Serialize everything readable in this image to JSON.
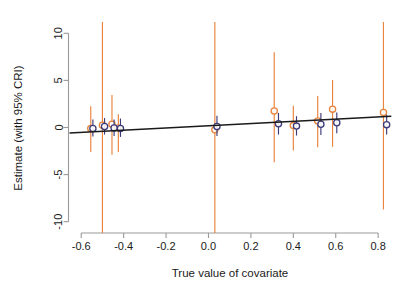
{
  "chart_data": {
    "type": "scatter",
    "title": "",
    "subtitle": "",
    "xlabel": "True value of covariate",
    "ylabel": "Estimate (with 95% CRI)",
    "xlim": [
      -0.66,
      0.87
    ],
    "ylim": [
      -11.2,
      11.2
    ],
    "grid": false,
    "legend": "none",
    "xticks": [
      -0.6,
      -0.4,
      -0.2,
      0.0,
      0.2,
      0.4,
      0.6,
      0.8
    ],
    "xtick_labels": [
      "-0.6",
      "-0.4",
      "-0.2",
      "0.0",
      "0.2",
      "0.4",
      "0.6",
      "0.8"
    ],
    "yticks": [
      -10,
      -5,
      0,
      5,
      10
    ],
    "ytick_labels": [
      "-10",
      "-5",
      "0",
      "5",
      "10"
    ],
    "colors": {
      "series_a": "#E8843C",
      "series_b": "#3B3B7A",
      "fit_line": "#1a1a1a",
      "axis": "#999999",
      "text": "#1a1a1a",
      "background": "#ffffff"
    },
    "series": [
      {
        "name": "series_a",
        "color": "#E8843C",
        "marker": "open-circle",
        "points": [
          {
            "x": -0.555,
            "y": -0.1,
            "lo": -2.6,
            "hi": 2.25
          },
          {
            "x": -0.5,
            "y": 0.25,
            "lo": -11.2,
            "hi": 11.2
          },
          {
            "x": -0.455,
            "y": 0.35,
            "lo": -2.9,
            "hi": 3.45
          },
          {
            "x": -0.425,
            "y": -0.05,
            "lo": -2.6,
            "hi": 1.4
          },
          {
            "x": 0.03,
            "y": -0.25,
            "lo": -11.2,
            "hi": 11.2
          },
          {
            "x": 0.31,
            "y": 1.75,
            "lo": -3.7,
            "hi": 8.0
          },
          {
            "x": 0.4,
            "y": 0.2,
            "lo": -2.45,
            "hi": 2.3
          },
          {
            "x": 0.515,
            "y": 0.7,
            "lo": -2.1,
            "hi": 3.35
          },
          {
            "x": 0.585,
            "y": 1.95,
            "lo": -2.05,
            "hi": 5.05
          },
          {
            "x": 0.825,
            "y": 1.6,
            "lo": -8.7,
            "hi": 11.2
          }
        ]
      },
      {
        "name": "series_b",
        "color": "#3B3B7A",
        "marker": "open-circle",
        "points": [
          {
            "x": -0.545,
            "y": -0.1,
            "lo": -0.95,
            "hi": 0.85
          },
          {
            "x": -0.49,
            "y": 0.1,
            "lo": -0.75,
            "hi": 1.0
          },
          {
            "x": -0.445,
            "y": -0.05,
            "lo": -0.9,
            "hi": 0.85
          },
          {
            "x": -0.415,
            "y": -0.1,
            "lo": -1.0,
            "hi": 0.95
          },
          {
            "x": 0.04,
            "y": 0.1,
            "lo": -0.9,
            "hi": 1.25
          },
          {
            "x": 0.33,
            "y": 0.4,
            "lo": -0.75,
            "hi": 1.55
          },
          {
            "x": 0.415,
            "y": 0.15,
            "lo": -0.85,
            "hi": 1.2
          },
          {
            "x": 0.53,
            "y": 0.35,
            "lo": -0.8,
            "hi": 1.55
          },
          {
            "x": 0.605,
            "y": 0.5,
            "lo": -0.6,
            "hi": 1.6
          },
          {
            "x": 0.84,
            "y": 0.3,
            "lo": -0.75,
            "hi": 1.35
          }
        ]
      }
    ],
    "fit_line": {
      "name": "fitted-regression-line",
      "color": "#1a1a1a",
      "x_start": -0.655,
      "y_start": -0.58,
      "x_end": 0.862,
      "y_end": 1.2
    }
  }
}
